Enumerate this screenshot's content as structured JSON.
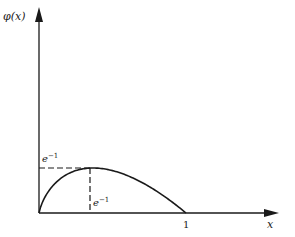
{
  "chart_data": {
    "type": "line",
    "title": "",
    "xlabel": "x",
    "ylabel": "φ(x)",
    "x_ticks": [
      {
        "value": 1,
        "label": "1"
      }
    ],
    "annotations": [
      {
        "type": "dashed-hline",
        "y": 0.3679,
        "label": "e⁻¹",
        "label_position": "y-axis"
      },
      {
        "type": "dashed-vline",
        "x": 0.3679,
        "label": "e⁻¹",
        "label_position": "x-axis"
      }
    ],
    "series": [
      {
        "name": "φ(x) = −x ln x",
        "x": [
          0,
          0.01,
          0.05,
          0.1,
          0.2,
          0.3,
          0.3679,
          0.4,
          0.5,
          0.6,
          0.7,
          0.8,
          0.9,
          1.0
        ],
        "values": [
          0,
          0.046,
          0.15,
          0.23,
          0.322,
          0.361,
          0.3679,
          0.367,
          0.347,
          0.306,
          0.25,
          0.179,
          0.095,
          0
        ]
      }
    ],
    "xlim": [
      0,
      1.6
    ],
    "ylim": [
      0,
      1.1
    ],
    "grid": false,
    "legend": "none"
  },
  "labels": {
    "y_axis": "φ(x)",
    "x_axis": "x",
    "peak_y": "e",
    "peak_y_exp": "−1",
    "peak_x": "e",
    "peak_x_exp": "−1",
    "x_tick_one": "1"
  }
}
